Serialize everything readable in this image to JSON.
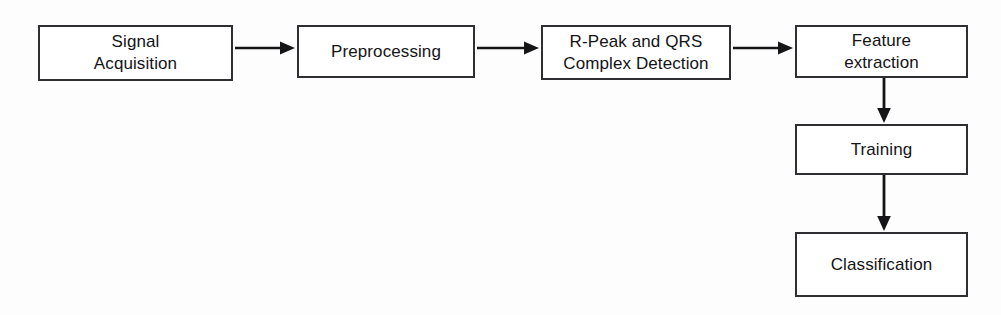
{
  "diagram": {
    "type": "flowchart",
    "orientation": "left-to-right then top-to-bottom",
    "background_color": "#fdfdfd",
    "box_border_color": "#2f2f33",
    "box_fill_color": "#ffffff",
    "arrow_color": "#151518",
    "text_color": "#141417",
    "nodes": [
      {
        "id": "signal-acquisition",
        "label": "Signal\nAcquisition",
        "line1": "Signal",
        "line2": "Acquisition",
        "x": 38,
        "y": 25,
        "width": 195,
        "height": 56
      },
      {
        "id": "preprocessing",
        "label": "Preprocessing",
        "line1": "Preprocessing",
        "line2": "",
        "x": 297,
        "y": 25,
        "width": 178,
        "height": 53
      },
      {
        "id": "rpeak-qrs-detection",
        "label": "R-Peak and QRS\nComplex Detection",
        "line1": "R-Peak and QRS",
        "line2": "Complex Detection",
        "x": 541,
        "y": 25,
        "width": 190,
        "height": 55
      },
      {
        "id": "feature-extraction",
        "label": "Feature\nextraction",
        "line1": "Feature",
        "line2": "extraction",
        "x": 795,
        "y": 25,
        "width": 173,
        "height": 53
      },
      {
        "id": "training",
        "label": "Training",
        "line1": "Training",
        "line2": "",
        "x": 795,
        "y": 124,
        "width": 173,
        "height": 51
      },
      {
        "id": "classification",
        "label": "Classification",
        "line1": "Classification",
        "line2": "",
        "x": 795,
        "y": 232,
        "width": 173,
        "height": 65
      }
    ],
    "edges": [
      {
        "id": "edge-signal-to-preprocessing",
        "from": "signal-acquisition",
        "to": "preprocessing",
        "direction": "right",
        "label": ""
      },
      {
        "id": "edge-preprocessing-to-rpeak",
        "from": "preprocessing",
        "to": "rpeak-qrs-detection",
        "direction": "right",
        "label": ""
      },
      {
        "id": "edge-rpeak-to-feature",
        "from": "rpeak-qrs-detection",
        "to": "feature-extraction",
        "direction": "right",
        "label": ""
      },
      {
        "id": "edge-feature-to-training",
        "from": "feature-extraction",
        "to": "training",
        "direction": "down",
        "label": ""
      },
      {
        "id": "edge-training-to-classification",
        "from": "training",
        "to": "classification",
        "direction": "down",
        "label": ""
      }
    ]
  }
}
